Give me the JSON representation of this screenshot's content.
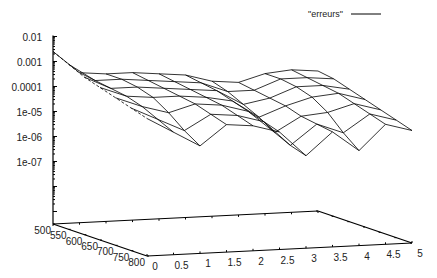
{
  "chart_data": {
    "type": "surface3d",
    "title": "",
    "legend": {
      "entries": [
        "\"erreurs\""
      ],
      "placement": "top-right"
    },
    "xlabel": "",
    "ylabel": "",
    "zlabel": "",
    "x_axis": {
      "range": [
        0,
        5
      ],
      "ticks": [
        "0",
        "0.5",
        "1",
        "1.5",
        "2",
        "2.5",
        "3",
        "3.5",
        "4",
        "4.5",
        "5"
      ]
    },
    "y_axis": {
      "range": [
        500,
        800
      ],
      "ticks": [
        "500",
        "550",
        "600",
        "650",
        "700",
        "750",
        "800"
      ]
    },
    "z_axis": {
      "scale": "log",
      "range": [
        1e-09,
        0.01
      ],
      "ticks": [
        "0.01",
        "0.001",
        "0.0001",
        "1e-05",
        "1e-06",
        "1e-07"
      ]
    },
    "x": [
      0,
      0.5,
      1,
      1.5,
      2,
      2.5,
      3,
      3.5,
      4,
      4.5,
      5
    ],
    "y": [
      500,
      550,
      600,
      650,
      700,
      750,
      800
    ],
    "log10_z": [
      [
        -2.6,
        -3.5,
        -3.6,
        -3.6,
        -3.7,
        -3.8,
        -4.1,
        -4.2,
        -3.9,
        -3.8,
        -3.9
      ],
      [
        -2.9,
        -3.6,
        -3.6,
        -3.7,
        -3.8,
        -3.9,
        -4.3,
        -4.3,
        -3.9,
        -3.9,
        -4.0
      ],
      [
        -3.2,
        -3.7,
        -3.7,
        -3.8,
        -3.9,
        -4.0,
        -4.6,
        -4.4,
        -4.0,
        -4.0,
        -4.2
      ],
      [
        -3.4,
        -3.8,
        -3.9,
        -3.9,
        -4.0,
        -4.2,
        -4.9,
        -4.5,
        -4.2,
        -4.1,
        -4.4
      ],
      [
        -3.6,
        -4.0,
        -4.3,
        -4.0,
        -4.1,
        -4.4,
        -5.3,
        -4.7,
        -4.6,
        -4.3,
        -4.6
      ],
      [
        -3.8,
        -4.3,
        -4.8,
        -4.2,
        -4.3,
        -4.6,
        -5.6,
        -4.8,
        -5.2,
        -4.5,
        -4.8
      ],
      [
        -4.0,
        -4.6,
        -5.2,
        -4.4,
        -4.5,
        -4.8,
        -5.8,
        -4.9,
        -5.7,
        -4.7,
        -5.0
      ]
    ]
  }
}
